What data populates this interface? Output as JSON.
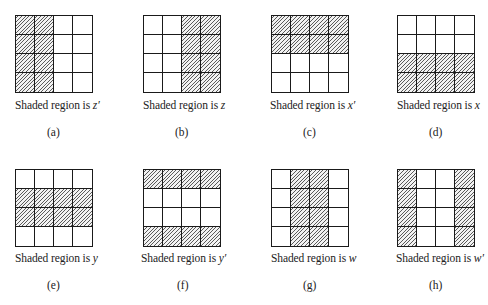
{
  "caption_prefix": "Shaded region is ",
  "panels": [
    {
      "label": "(a)",
      "variable": "z′",
      "shaded": [
        [
          1,
          1,
          0,
          0
        ],
        [
          1,
          1,
          0,
          0
        ],
        [
          1,
          1,
          0,
          0
        ],
        [
          1,
          1,
          0,
          0
        ]
      ],
      "grid_x": 15,
      "grid_y": 15,
      "caption_x": 15,
      "caption_y": 99,
      "label_x": 47,
      "label_y": 126
    },
    {
      "label": "(b)",
      "variable": "z",
      "shaded": [
        [
          0,
          0,
          1,
          1
        ],
        [
          0,
          0,
          1,
          1
        ],
        [
          0,
          0,
          1,
          1
        ],
        [
          0,
          0,
          1,
          1
        ]
      ],
      "grid_x": 143,
      "grid_y": 15,
      "caption_x": 143,
      "caption_y": 99,
      "label_x": 175,
      "label_y": 126
    },
    {
      "label": "(c)",
      "variable": "x′",
      "shaded": [
        [
          1,
          1,
          1,
          1
        ],
        [
          1,
          1,
          1,
          1
        ],
        [
          0,
          0,
          0,
          0
        ],
        [
          0,
          0,
          0,
          0
        ]
      ],
      "grid_x": 271,
      "grid_y": 15,
      "caption_x": 270,
      "caption_y": 99,
      "label_x": 303,
      "label_y": 126
    },
    {
      "label": "(d)",
      "variable": "x",
      "shaded": [
        [
          0,
          0,
          0,
          0
        ],
        [
          0,
          0,
          0,
          0
        ],
        [
          1,
          1,
          1,
          1
        ],
        [
          1,
          1,
          1,
          1
        ]
      ],
      "grid_x": 397,
      "grid_y": 15,
      "caption_x": 397,
      "caption_y": 99,
      "label_x": 429,
      "label_y": 126
    },
    {
      "label": "(e)",
      "variable": "y",
      "shaded": [
        [
          0,
          0,
          0,
          0
        ],
        [
          1,
          1,
          1,
          1
        ],
        [
          1,
          1,
          1,
          1
        ],
        [
          0,
          0,
          0,
          0
        ]
      ],
      "grid_x": 15,
      "grid_y": 169,
      "caption_x": 15,
      "caption_y": 252,
      "label_x": 47,
      "label_y": 279
    },
    {
      "label": "(f)",
      "variable": "y′",
      "shaded": [
        [
          1,
          1,
          1,
          1
        ],
        [
          0,
          0,
          0,
          0
        ],
        [
          0,
          0,
          0,
          0
        ],
        [
          1,
          1,
          1,
          1
        ]
      ],
      "grid_x": 143,
      "grid_y": 169,
      "caption_x": 141,
      "caption_y": 252,
      "label_x": 177,
      "label_y": 279
    },
    {
      "label": "(g)",
      "variable": "w",
      "shaded": [
        [
          0,
          1,
          1,
          0
        ],
        [
          0,
          1,
          1,
          0
        ],
        [
          0,
          1,
          1,
          0
        ],
        [
          0,
          1,
          1,
          0
        ]
      ],
      "grid_x": 271,
      "grid_y": 169,
      "caption_x": 271,
      "caption_y": 252,
      "label_x": 303,
      "label_y": 279
    },
    {
      "label": "(h)",
      "variable": "w′",
      "shaded": [
        [
          1,
          0,
          0,
          1
        ],
        [
          1,
          0,
          0,
          1
        ],
        [
          1,
          0,
          0,
          1
        ],
        [
          1,
          0,
          0,
          1
        ]
      ],
      "grid_x": 397,
      "grid_y": 169,
      "caption_x": 396,
      "caption_y": 252,
      "label_x": 429,
      "label_y": 279
    }
  ]
}
